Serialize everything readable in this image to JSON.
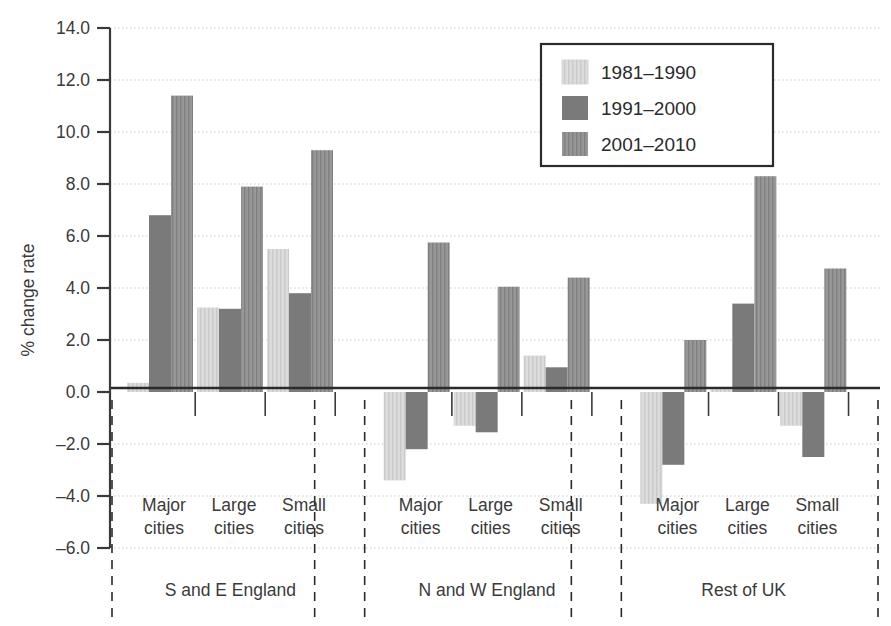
{
  "chart_data": {
    "type": "bar",
    "title": "",
    "xlabel": "",
    "ylabel": "% change rate",
    "ylim": [
      -6.0,
      14.0
    ],
    "ytick_step": 2.0,
    "yticks": [
      "14.0",
      "12.0",
      "10.0",
      "8.0",
      "6.0",
      "4.0",
      "2.0",
      "0.0",
      "-2.0",
      "-4.0",
      "-6.0"
    ],
    "ytick_values": [
      14,
      12,
      10,
      8,
      6,
      4,
      2,
      0,
      -2,
      -4,
      -6
    ],
    "grid": true,
    "grid_style": "dotted-horizontal",
    "legend_position": "top-right",
    "categories": [
      "Major cities",
      "Large cities",
      "Small cities"
    ],
    "groups": [
      {
        "name": "S and E England",
        "categories": [
          "Major cities",
          "Large cities",
          "Small cities"
        ],
        "series_values": {
          "1981-1990": [
            0.35,
            3.25,
            5.5
          ],
          "1991-2000": [
            6.8,
            3.2,
            3.8
          ],
          "2001-2010": [
            11.4,
            7.9,
            9.3
          ]
        }
      },
      {
        "name": "N and W England",
        "categories": [
          "Major cities",
          "Large cities",
          "Small cities"
        ],
        "series_values": {
          "1981-1990": [
            -3.4,
            -1.3,
            1.4
          ],
          "1991-2000": [
            -2.2,
            -1.55,
            0.95
          ],
          "2001-2010": [
            5.75,
            4.05,
            4.4
          ]
        }
      },
      {
        "name": "Rest of UK",
        "categories": [
          "Major cities",
          "Large cities",
          "Small cities"
        ],
        "series_values": {
          "1981-1990": [
            -4.3,
            0.1,
            -1.3
          ],
          "1991-2000": [
            -2.8,
            3.4,
            -2.5
          ],
          "2001-2010": [
            2.0,
            8.3,
            4.75
          ]
        }
      }
    ],
    "series": [
      {
        "name": "1981-1990",
        "label": "1981–1990",
        "color": "#d6d6d6",
        "pattern": "vertical-stripes"
      },
      {
        "name": "1991-2000",
        "label": "1991–2000",
        "color": "#7a7a7a",
        "pattern": "solid"
      },
      {
        "name": "2001-2010",
        "label": "2001–2010",
        "color": "#8e8e8e",
        "pattern": "vertical-stripes"
      }
    ]
  },
  "legend": {
    "entries": [
      {
        "label": "1981–1990"
      },
      {
        "label": "1991–2000"
      },
      {
        "label": "2001–2010"
      }
    ]
  },
  "axis": {
    "y_title": "% change rate"
  },
  "category_labels": {
    "major_line1": "Major",
    "major_line2": "cities",
    "large_line1": "Large",
    "large_line2": "cities",
    "small_line1": "Small",
    "small_line2": "cities"
  },
  "group_labels": {
    "g1": "S and E England",
    "g2": "N and W England",
    "g3": "Rest of UK"
  },
  "colors": {
    "series1": "#d6d6d6",
    "series2": "#7a7a7a",
    "series3": "#8e8e8e",
    "axis": "#3a3a3a",
    "grid": "#c9c9c9",
    "background": "#ffffff"
  }
}
